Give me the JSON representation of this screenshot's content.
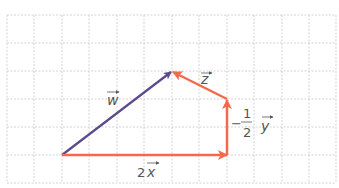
{
  "diagram": {
    "title": "",
    "grid": {
      "x0": 7,
      "y0": 15,
      "cell_w": 27.4,
      "cell_h": 28,
      "cols": 12,
      "rows": 6,
      "color": "#c8c8c8"
    },
    "colors": {
      "purple": "#5b4a8c",
      "orange": "#f26a4b"
    },
    "vectors": [
      {
        "name": "w",
        "label": "w",
        "from": [
          62,
          155
        ],
        "to": [
          172,
          71
        ],
        "color": "#5b4a8c"
      },
      {
        "name": "2x",
        "label_coef": "2",
        "label": "x",
        "from": [
          62,
          155
        ],
        "to": [
          227,
          155
        ],
        "color": "#f26a4b"
      },
      {
        "name": "-1/2 y",
        "label_coef": "−",
        "label_num": "1",
        "label_den": "2",
        "label": "y",
        "from": [
          227,
          155
        ],
        "to": [
          227,
          99
        ],
        "color": "#f26a4b"
      },
      {
        "name": "z",
        "label": "z",
        "from": [
          227,
          99
        ],
        "to": [
          172,
          71
        ],
        "color": "#f26a4b"
      }
    ]
  }
}
